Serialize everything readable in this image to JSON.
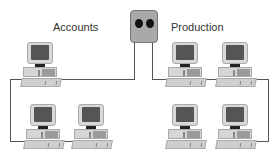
{
  "diagram": {
    "type": "network-topology",
    "hub": {
      "name": "hub",
      "ports": 2
    },
    "groups": [
      {
        "label": "Accounts",
        "computers": 3
      },
      {
        "label": "Production",
        "computers": 4
      }
    ]
  },
  "colors": {
    "cable": "#555555",
    "hub": "#a9a9a9",
    "hub_port": "#111111",
    "monitor_screen": "#555555",
    "computer_body": "#d6d6d6"
  }
}
